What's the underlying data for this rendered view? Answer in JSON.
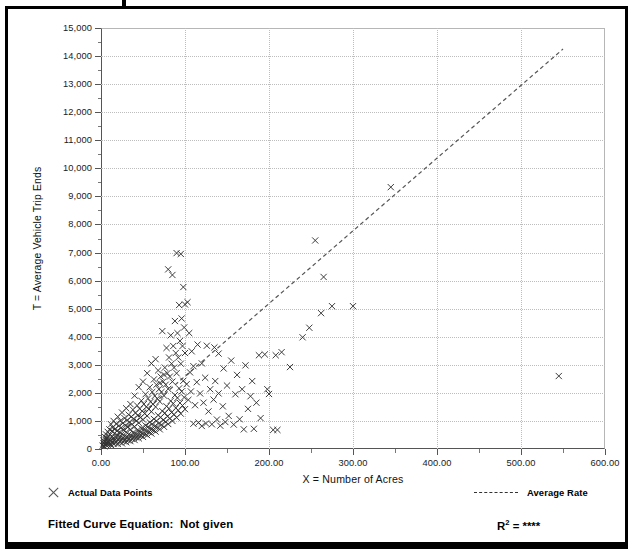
{
  "chart_data": {
    "type": "scatter",
    "title": "",
    "xlabel": "X = Number of Acres",
    "ylabel": "T = Average Vehicle Trip Ends",
    "xlim": [
      0,
      600
    ],
    "ylim": [
      0,
      15000
    ],
    "xticks": [
      "0.00",
      "100.00",
      "200.00",
      "300.00",
      "400.00",
      "500.00",
      "600.00"
    ],
    "xtick_values": [
      0,
      100,
      200,
      300,
      400,
      500,
      600
    ],
    "yticks": [
      "0",
      "1,000",
      "2,000",
      "3,000",
      "4,000",
      "5,000",
      "6,000",
      "7,000",
      "8,000",
      "9,000",
      "10,000",
      "11,000",
      "12,000",
      "13,000",
      "14,000",
      "15,000"
    ],
    "ytick_values": [
      0,
      1000,
      2000,
      3000,
      4000,
      5000,
      6000,
      7000,
      8000,
      9000,
      10000,
      11000,
      12000,
      13000,
      14000,
      15000
    ],
    "grid": true,
    "legend_position": "below-plot",
    "series": [
      {
        "name": "Actual Data Points",
        "type": "scatter",
        "marker": "x",
        "color": "#333333",
        "points": [
          [
            2,
            120
          ],
          [
            3,
            200
          ],
          [
            3,
            310
          ],
          [
            4,
            95
          ],
          [
            4,
            260
          ],
          [
            5,
            180
          ],
          [
            5,
            420
          ],
          [
            6,
            140
          ],
          [
            6,
            330
          ],
          [
            6,
            520
          ],
          [
            7,
            210
          ],
          [
            7,
            390
          ],
          [
            8,
            150
          ],
          [
            8,
            280
          ],
          [
            8,
            610
          ],
          [
            9,
            240
          ],
          [
            9,
            460
          ],
          [
            10,
            170
          ],
          [
            10,
            350
          ],
          [
            10,
            700
          ],
          [
            11,
            190
          ],
          [
            11,
            520
          ],
          [
            12,
            140
          ],
          [
            12,
            300
          ],
          [
            12,
            880
          ],
          [
            13,
            420
          ],
          [
            13,
            640
          ],
          [
            14,
            230
          ],
          [
            14,
            760
          ],
          [
            15,
            180
          ],
          [
            15,
            400
          ],
          [
            15,
            1000
          ],
          [
            16,
            300
          ],
          [
            16,
            560
          ],
          [
            17,
            220
          ],
          [
            17,
            720
          ],
          [
            18,
            410
          ],
          [
            18,
            900
          ],
          [
            19,
            270
          ],
          [
            19,
            640
          ],
          [
            20,
            180
          ],
          [
            20,
            480
          ],
          [
            20,
            1150
          ],
          [
            21,
            350
          ],
          [
            21,
            820
          ],
          [
            22,
            260
          ],
          [
            22,
            600
          ],
          [
            23,
            430
          ],
          [
            23,
            1000
          ],
          [
            24,
            310
          ],
          [
            24,
            760
          ],
          [
            25,
            200
          ],
          [
            25,
            540
          ],
          [
            25,
            1300
          ],
          [
            26,
            390
          ],
          [
            26,
            920
          ],
          [
            27,
            280
          ],
          [
            27,
            680
          ],
          [
            28,
            460
          ],
          [
            28,
            1100
          ],
          [
            29,
            340
          ],
          [
            29,
            840
          ],
          [
            30,
            240
          ],
          [
            30,
            600
          ],
          [
            30,
            1450
          ],
          [
            31,
            420
          ],
          [
            31,
            1020
          ],
          [
            32,
            310
          ],
          [
            32,
            780
          ],
          [
            33,
            520
          ],
          [
            33,
            1220
          ],
          [
            34,
            380
          ],
          [
            34,
            960
          ],
          [
            35,
            280
          ],
          [
            35,
            700
          ],
          [
            35,
            1600
          ],
          [
            36,
            480
          ],
          [
            36,
            1150
          ],
          [
            37,
            360
          ],
          [
            37,
            880
          ],
          [
            38,
            580
          ],
          [
            38,
            1400
          ],
          [
            39,
            430
          ],
          [
            39,
            1080
          ],
          [
            40,
            320
          ],
          [
            40,
            800
          ],
          [
            40,
            1900
          ],
          [
            41,
            540
          ],
          [
            41,
            1280
          ],
          [
            42,
            410
          ],
          [
            42,
            1000
          ],
          [
            43,
            660
          ],
          [
            43,
            1550
          ],
          [
            44,
            490
          ],
          [
            44,
            1200
          ],
          [
            45,
            380
          ],
          [
            45,
            930
          ],
          [
            45,
            2200
          ],
          [
            46,
            620
          ],
          [
            46,
            1430
          ],
          [
            47,
            470
          ],
          [
            47,
            1120
          ],
          [
            48,
            740
          ],
          [
            48,
            1720
          ],
          [
            49,
            560
          ],
          [
            49,
            1350
          ],
          [
            50,
            430
          ],
          [
            50,
            1050
          ],
          [
            50,
            2400
          ],
          [
            51,
            700
          ],
          [
            51,
            1600
          ],
          [
            52,
            530
          ],
          [
            52,
            1260
          ],
          [
            53,
            840
          ],
          [
            53,
            1950
          ],
          [
            54,
            640
          ],
          [
            54,
            1500
          ],
          [
            55,
            490
          ],
          [
            55,
            1180
          ],
          [
            55,
            2700
          ],
          [
            56,
            790
          ],
          [
            56,
            1800
          ],
          [
            57,
            600
          ],
          [
            57,
            1420
          ],
          [
            58,
            950
          ],
          [
            58,
            2200
          ],
          [
            59,
            720
          ],
          [
            59,
            1680
          ],
          [
            60,
            550
          ],
          [
            60,
            1330
          ],
          [
            60,
            3050
          ],
          [
            61,
            890
          ],
          [
            61,
            2030
          ],
          [
            62,
            680
          ],
          [
            62,
            1600
          ],
          [
            63,
            1070
          ],
          [
            63,
            2480
          ],
          [
            64,
            810
          ],
          [
            64,
            1890
          ],
          [
            65,
            620
          ],
          [
            65,
            1500
          ],
          [
            65,
            3200
          ],
          [
            66,
            1000
          ],
          [
            66,
            2290
          ],
          [
            67,
            770
          ],
          [
            67,
            1800
          ],
          [
            68,
            1200
          ],
          [
            68,
            2800
          ],
          [
            69,
            910
          ],
          [
            69,
            2130
          ],
          [
            70,
            700
          ],
          [
            70,
            1690
          ],
          [
            70,
            2350
          ],
          [
            71,
            1130
          ],
          [
            71,
            2580
          ],
          [
            72,
            860
          ],
          [
            72,
            2030
          ],
          [
            73,
            1350
          ],
          [
            73,
            4200
          ],
          [
            74,
            1030
          ],
          [
            74,
            2400
          ],
          [
            75,
            790
          ],
          [
            75,
            1900
          ],
          [
            75,
            2650
          ],
          [
            76,
            1280
          ],
          [
            76,
            2900
          ],
          [
            77,
            970
          ],
          [
            77,
            2290
          ],
          [
            78,
            1520
          ],
          [
            78,
            3600
          ],
          [
            79,
            1160
          ],
          [
            79,
            2700
          ],
          [
            80,
            890
          ],
          [
            80,
            2140
          ],
          [
            80,
            6400
          ],
          [
            81,
            1440
          ],
          [
            81,
            3260
          ],
          [
            82,
            1090
          ],
          [
            82,
            2580
          ],
          [
            83,
            1710
          ],
          [
            83,
            4050
          ],
          [
            84,
            1300
          ],
          [
            84,
            3040
          ],
          [
            85,
            1000
          ],
          [
            85,
            2400
          ],
          [
            85,
            6200
          ],
          [
            86,
            1620
          ],
          [
            86,
            3670
          ],
          [
            87,
            1230
          ],
          [
            87,
            2900
          ],
          [
            88,
            1920
          ],
          [
            88,
            4560
          ],
          [
            89,
            1460
          ],
          [
            89,
            3420
          ],
          [
            90,
            1120
          ],
          [
            90,
            2700
          ],
          [
            90,
            6980
          ],
          [
            91,
            1820
          ],
          [
            91,
            4130
          ],
          [
            92,
            1380
          ],
          [
            92,
            3260
          ],
          [
            93,
            2160
          ],
          [
            93,
            5130
          ],
          [
            94,
            1640
          ],
          [
            94,
            3850
          ],
          [
            95,
            1260
          ],
          [
            95,
            3040
          ],
          [
            95,
            6950
          ],
          [
            96,
            2050
          ],
          [
            96,
            4650
          ],
          [
            97,
            1550
          ],
          [
            97,
            3670
          ],
          [
            98,
            2430
          ],
          [
            98,
            5770
          ],
          [
            99,
            1840
          ],
          [
            99,
            4330
          ],
          [
            100,
            1420
          ],
          [
            100,
            3420
          ],
          [
            100,
            5150
          ],
          [
            102,
            2310
          ],
          [
            103,
            5230
          ],
          [
            104,
            1750
          ],
          [
            105,
            4130
          ],
          [
            106,
            2730
          ],
          [
            107,
            2050
          ],
          [
            108,
            3480
          ],
          [
            110,
            900
          ],
          [
            110,
            2950
          ],
          [
            112,
            1560
          ],
          [
            114,
            2380
          ],
          [
            115,
            3720
          ],
          [
            116,
            940
          ],
          [
            118,
            1980
          ],
          [
            120,
            820
          ],
          [
            120,
            3050
          ],
          [
            122,
            1650
          ],
          [
            124,
            2540
          ],
          [
            125,
            910
          ],
          [
            126,
            3680
          ],
          [
            128,
            1340
          ],
          [
            130,
            2130
          ],
          [
            132,
            880
          ],
          [
            134,
            1760
          ],
          [
            135,
            3620
          ],
          [
            136,
            2420
          ],
          [
            138,
            1050
          ],
          [
            140,
            1980
          ],
          [
            140,
            3400
          ],
          [
            142,
            830
          ],
          [
            145,
            1520
          ],
          [
            146,
            2870
          ],
          [
            148,
            960
          ],
          [
            150,
            2260
          ],
          [
            152,
            1180
          ],
          [
            155,
            3150
          ],
          [
            158,
            870
          ],
          [
            160,
            1950
          ],
          [
            162,
            2640
          ],
          [
            165,
            1060
          ],
          [
            168,
            2130
          ],
          [
            170,
            700
          ],
          [
            172,
            2980
          ],
          [
            175,
            1430
          ],
          [
            178,
            1880
          ],
          [
            180,
            2420
          ],
          [
            182,
            720
          ],
          [
            185,
            1650
          ],
          [
            188,
            3340
          ],
          [
            190,
            1100
          ],
          [
            195,
            3370
          ],
          [
            198,
            2130
          ],
          [
            200,
            1960
          ],
          [
            205,
            680
          ],
          [
            208,
            3340
          ],
          [
            210,
            680
          ],
          [
            215,
            3450
          ],
          [
            225,
            2920
          ],
          [
            240,
            3980
          ],
          [
            248,
            4320
          ],
          [
            255,
            7430
          ],
          [
            262,
            4840
          ],
          [
            265,
            6130
          ],
          [
            275,
            5090
          ],
          [
            300,
            5090
          ],
          [
            345,
            9330
          ],
          [
            545,
            2600
          ]
        ]
      }
    ],
    "trendline": {
      "name": "Average Rate",
      "style": "dashed",
      "color": "#555555",
      "x_start": 0,
      "y_start": 0,
      "x_end": 550,
      "y_end": 14250
    }
  },
  "legend": {
    "data_points_label": "Actual Data Points",
    "data_points_marker": "x-marker-icon",
    "average_rate_label": "Average Rate",
    "average_rate_marker": "dashed-line-icon"
  },
  "footer": {
    "fitted_curve_label": "Fitted Curve Equation:",
    "fitted_curve_value": "Not given",
    "r2_label": "R",
    "r2_exponent": "2",
    "r2_equals": " = ",
    "r2_value": "****"
  }
}
